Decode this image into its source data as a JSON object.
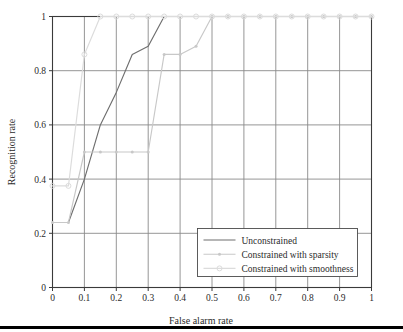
{
  "figure": {
    "background_color": "#ffffff",
    "bottom_rule_color": "#000000",
    "frame_color": "#3a3a3a",
    "grid_color": "#8a8a8a"
  },
  "chart_data": {
    "type": "line",
    "title": "",
    "xlabel": "False alarm rate",
    "ylabel": "Recognition rate",
    "xlim": [
      0,
      1
    ],
    "ylim": [
      0,
      1
    ],
    "xticks": [
      "0",
      "0.1",
      "0.2",
      "0.3",
      "0.4",
      "0.5",
      "0.6",
      "0.7",
      "0.8",
      "0.9",
      "1"
    ],
    "xtick_values": [
      0,
      0.1,
      0.2,
      0.3,
      0.4,
      0.5,
      0.6,
      0.7,
      0.8,
      0.9,
      1
    ],
    "yticks": [
      "0",
      "0.2",
      "0.4",
      "0.6",
      "0.8",
      "1"
    ],
    "ytick_values": [
      0,
      0.2,
      0.4,
      0.6,
      0.8,
      1
    ],
    "grid": true,
    "legend_position": "lower right",
    "series": [
      {
        "name": "Unconstrained",
        "color": "#6e6e6e",
        "marker": "none",
        "x": [
          0,
          0.05,
          0.1,
          0.15,
          0.2,
          0.25,
          0.3,
          0.35,
          0.4,
          0.45,
          0.5,
          0.55,
          0.6,
          0.65,
          0.7,
          0.75,
          0.8,
          0.85,
          0.9,
          0.95,
          1
        ],
        "values": [
          0.24,
          0.24,
          0.4,
          0.6,
          0.72,
          0.86,
          0.89,
          1,
          1,
          1,
          1,
          1,
          1,
          1,
          1,
          1,
          1,
          1,
          1,
          1,
          1
        ]
      },
      {
        "name": "Constrained with sparsity",
        "color": "#c8c8c8",
        "marker": "dot",
        "x": [
          0,
          0.05,
          0.1,
          0.15,
          0.2,
          0.25,
          0.3,
          0.35,
          0.4,
          0.45,
          0.5,
          0.55,
          0.6,
          0.65,
          0.7,
          0.75,
          0.8,
          0.85,
          0.9,
          0.95,
          1
        ],
        "values": [
          0.24,
          0.24,
          0.5,
          0.5,
          0.5,
          0.5,
          0.5,
          0.86,
          0.86,
          0.89,
          1,
          1,
          1,
          1,
          1,
          1,
          1,
          1,
          1,
          1,
          1
        ]
      },
      {
        "name": "Constrained with smoothness",
        "color": "#dcdcdc",
        "marker": "circle",
        "x": [
          0,
          0.05,
          0.1,
          0.15,
          0.2,
          0.25,
          0.3,
          0.35,
          0.4,
          0.45,
          0.5,
          0.55,
          0.6,
          0.65,
          0.7,
          0.75,
          0.8,
          0.85,
          0.9,
          0.95,
          1
        ],
        "values": [
          0.375,
          0.375,
          0.86,
          1,
          1,
          1,
          1,
          1,
          1,
          1,
          1,
          1,
          1,
          1,
          1,
          1,
          1,
          1,
          1,
          1,
          1
        ]
      }
    ],
    "legend_entries": [
      {
        "label": "Unconstrained",
        "color": "#6e6e6e",
        "marker": "none"
      },
      {
        "label": "Constrained with sparsity",
        "color": "#c8c8c8",
        "marker": "dot"
      },
      {
        "label": "Constrained with smoothness",
        "color": "#dcdcdc",
        "marker": "circle"
      }
    ]
  }
}
